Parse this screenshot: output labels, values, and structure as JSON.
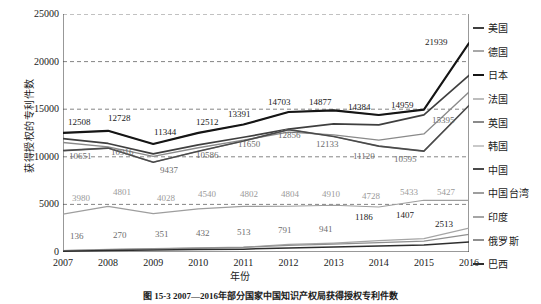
{
  "chart_data": {
    "type": "line",
    "title": "",
    "xlabel": "年份",
    "ylabel": "获得授权的专利件数",
    "x": [
      "2007",
      "2008",
      "2009",
      "2010",
      "2011",
      "2012",
      "2013",
      "2014",
      "2015",
      "2016"
    ],
    "xlim": [
      2007,
      2016
    ],
    "ylim": [
      0,
      25000
    ],
    "yticks": [
      "0",
      "5000",
      "10000",
      "15000",
      "20000",
      "25000"
    ],
    "grid": "horizontal-dashed",
    "legend_position": "right",
    "series": [
      {
        "name": "美国",
        "color": "#3f3f3f",
        "width": 1.7,
        "values": [
          11900,
          11400,
          10300,
          11250,
          12050,
          12900,
          13450,
          13350,
          14400,
          18550
        ],
        "labels": []
      },
      {
        "name": "德国",
        "color": "#a8a8a8",
        "width": 1.2,
        "values": [
          12508,
          12728,
          11344,
          12512,
          13391,
          14703,
          14877,
          14384,
          14959,
          21939
        ],
        "labels": [
          "12508",
          "12728",
          "11344",
          "12512",
          "13391",
          "14703",
          "14877",
          "14384",
          "14959",
          "21939"
        ]
      },
      {
        "name": "日本",
        "color": "#151515",
        "width": 2.1,
        "values": [
          12508,
          12728,
          11344,
          12512,
          13391,
          14703,
          14877,
          14384,
          14959,
          21939
        ],
        "labels": []
      },
      {
        "name": "法国",
        "color": "#bdbdbd",
        "width": 1.2,
        "values": [
          10651,
          10916,
          9437,
          10586,
          11650,
          12856,
          12133,
          11120,
          10595,
          15395
        ],
        "labels": [
          "10651",
          "10916",
          "9437",
          "10586",
          "11650",
          "12856",
          "12133",
          "11120",
          "10595",
          "15395"
        ]
      },
      {
        "name": "英国",
        "color": "#8a8a8a",
        "width": 1.3,
        "values": [
          11500,
          11050,
          10050,
          10950,
          11750,
          12600,
          12300,
          11750,
          12400,
          16800
        ],
        "labels": []
      },
      {
        "name": "韩国",
        "color": "#c9c9c9",
        "width": 1.2,
        "values": [
          10651,
          10916,
          9437,
          10586,
          11650,
          12856,
          12133,
          11120,
          10595,
          15395
        ],
        "labels": []
      },
      {
        "name": "中国",
        "color": "#4a4a4a",
        "width": 1.6,
        "values": [
          10651,
          10916,
          9437,
          10586,
          11650,
          12856,
          12133,
          11120,
          10595,
          15395
        ],
        "labels": []
      },
      {
        "name": "中国台湾",
        "color": "#9e9e9e",
        "width": 1.2,
        "values": [
          3980,
          4801,
          4028,
          4540,
          4802,
          4804,
          4910,
          4728,
          5433,
          5427
        ],
        "labels": [
          "3980",
          "4801",
          "4028",
          "4540",
          "4802",
          "4804",
          "4910",
          "4728",
          "5433",
          "5427"
        ]
      },
      {
        "name": "印度",
        "color": "#a5a5a5",
        "width": 1.2,
        "values": [
          136,
          270,
          351,
          432,
          513,
          791,
          941,
          1186,
          1407,
          2513
        ],
        "labels": [
          "136",
          "270",
          "351",
          "432",
          "513",
          "791",
          "941",
          "1186",
          "1407",
          "2513"
        ]
      },
      {
        "name": "俄罗斯",
        "color": "#8f8f8f",
        "width": 1.2,
        "values": [
          150,
          250,
          330,
          400,
          480,
          700,
          820,
          980,
          1150,
          1850
        ],
        "labels": []
      },
      {
        "name": "巴西",
        "color": "#2e2e2e",
        "width": 1.5,
        "values": [
          90,
          150,
          200,
          250,
          300,
          420,
          520,
          620,
          740,
          1050
        ],
        "labels": []
      }
    ]
  },
  "legend": {
    "items": [
      {
        "label": "美国",
        "color": "#3f3f3f",
        "width": 2
      },
      {
        "label": "德国",
        "color": "#a8a8a8",
        "width": 2
      },
      {
        "label": "日本",
        "color": "#151515",
        "width": 2.4
      },
      {
        "label": "法国",
        "color": "#bdbdbd",
        "width": 2
      },
      {
        "label": "英国",
        "color": "#8a8a8a",
        "width": 2
      },
      {
        "label": "韩国",
        "color": "#c9c9c9",
        "width": 2
      },
      {
        "label": "中国",
        "color": "#4a4a4a",
        "width": 2.2
      },
      {
        "label": "中国台湾",
        "color": "#9e9e9e",
        "width": 2.2
      },
      {
        "label": "印度",
        "color": "#a5a5a5",
        "width": 2
      },
      {
        "label": "俄罗斯",
        "color": "#8f8f8f",
        "width": 2
      },
      {
        "label": "巴西",
        "color": "#2e2e2e",
        "width": 2.2
      }
    ]
  },
  "caption": {
    "text": "图 15-3  2007—2016年部分国家中国知识产权局获得授权专利件数"
  },
  "label_overrides": [
    {
      "text": "12508",
      "x": 68,
      "y": 118,
      "cls": "dlabel"
    },
    {
      "text": "12728",
      "x": 108,
      "y": 114,
      "cls": "dlabel"
    },
    {
      "text": "11344",
      "x": 154,
      "y": 128,
      "cls": "dlabel"
    },
    {
      "text": "12512",
      "x": 196,
      "y": 118,
      "cls": "dlabel"
    },
    {
      "text": "13391",
      "x": 228,
      "y": 110,
      "cls": "dlabel"
    },
    {
      "text": "14703",
      "x": 268,
      "y": 98,
      "cls": "dlabel"
    },
    {
      "text": "14877",
      "x": 309,
      "y": 98,
      "cls": "dlabel"
    },
    {
      "text": "14384",
      "x": 348,
      "y": 103,
      "cls": "dlabel"
    },
    {
      "text": "14959",
      "x": 391,
      "y": 101,
      "cls": "dlabel"
    },
    {
      "text": "21939",
      "x": 425,
      "y": 38,
      "cls": "dlabel"
    },
    {
      "text": "10651",
      "x": 69,
      "y": 152,
      "cls": "dlabel mid"
    },
    {
      "text": "10916",
      "x": 111,
      "y": 148,
      "cls": "dlabel mid"
    },
    {
      "text": "9437",
      "x": 160,
      "y": 166,
      "cls": "dlabel mid"
    },
    {
      "text": "10586",
      "x": 196,
      "y": 151,
      "cls": "dlabel mid"
    },
    {
      "text": "11650",
      "x": 238,
      "y": 140,
      "cls": "dlabel mid"
    },
    {
      "text": "12856",
      "x": 278,
      "y": 131,
      "cls": "dlabel mid"
    },
    {
      "text": "12133",
      "x": 316,
      "y": 140,
      "cls": "dlabel mid"
    },
    {
      "text": "11120",
      "x": 353,
      "y": 152,
      "cls": "dlabel mid"
    },
    {
      "text": "10595",
      "x": 394,
      "y": 155,
      "cls": "dlabel mid"
    },
    {
      "text": "15395",
      "x": 432,
      "y": 116,
      "cls": "dlabel mid"
    },
    {
      "text": "3980",
      "x": 72,
      "y": 194,
      "cls": "dlabel light"
    },
    {
      "text": "4801",
      "x": 113,
      "y": 188,
      "cls": "dlabel light"
    },
    {
      "text": "4028",
      "x": 157,
      "y": 194,
      "cls": "dlabel light"
    },
    {
      "text": "4540",
      "x": 198,
      "y": 190,
      "cls": "dlabel light"
    },
    {
      "text": "4802",
      "x": 240,
      "y": 190,
      "cls": "dlabel light"
    },
    {
      "text": "4804",
      "x": 281,
      "y": 190,
      "cls": "dlabel light"
    },
    {
      "text": "4910",
      "x": 322,
      "y": 190,
      "cls": "dlabel light"
    },
    {
      "text": "4728",
      "x": 362,
      "y": 192,
      "cls": "dlabel light"
    },
    {
      "text": "5433",
      "x": 400,
      "y": 188,
      "cls": "dlabel light"
    },
    {
      "text": "5427",
      "x": 437,
      "y": 188,
      "cls": "dlabel light"
    },
    {
      "text": "136",
      "x": 70,
      "y": 232,
      "cls": "dlabel mid"
    },
    {
      "text": "270",
      "x": 113,
      "y": 231,
      "cls": "dlabel mid"
    },
    {
      "text": "351",
      "x": 155,
      "y": 230,
      "cls": "dlabel mid"
    },
    {
      "text": "432",
      "x": 196,
      "y": 229,
      "cls": "dlabel mid"
    },
    {
      "text": "513",
      "x": 237,
      "y": 228,
      "cls": "dlabel mid"
    },
    {
      "text": "791",
      "x": 278,
      "y": 226,
      "cls": "dlabel mid"
    },
    {
      "text": "941",
      "x": 319,
      "y": 225,
      "cls": "dlabel mid"
    },
    {
      "text": "1186",
      "x": 355,
      "y": 213,
      "cls": "dlabel"
    },
    {
      "text": "1407",
      "x": 396,
      "y": 211,
      "cls": "dlabel"
    },
    {
      "text": "2513",
      "x": 435,
      "y": 220,
      "cls": "dlabel"
    }
  ]
}
